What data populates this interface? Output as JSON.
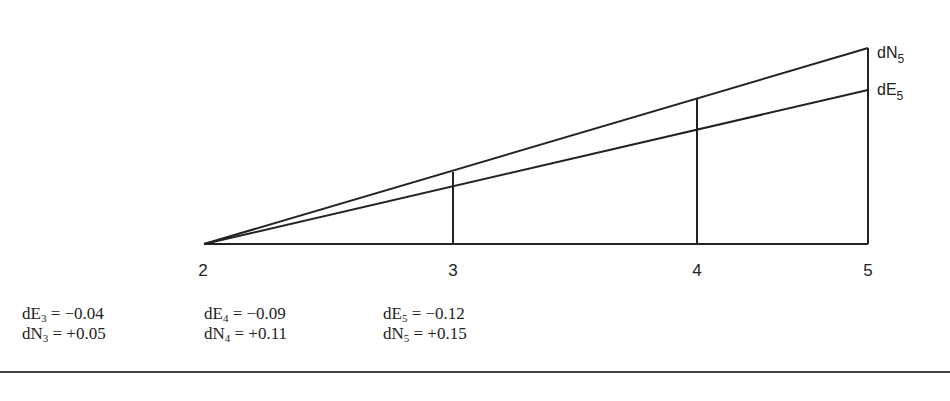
{
  "diagram": {
    "type": "traverse-error-proportioning",
    "stations": [
      {
        "label": "2",
        "x": 204
      },
      {
        "label": "3",
        "x": 453
      },
      {
        "label": "4",
        "x": 697
      },
      {
        "label": "5",
        "x": 868
      }
    ],
    "baseline_y": 244,
    "lines": {
      "dN": {
        "label_main": "dN",
        "label_sub": "5",
        "end_y": 48,
        "crossings_y": [
          172,
          99,
          48
        ]
      },
      "dE": {
        "label_main": "dE",
        "label_sub": "5",
        "end_y": 90,
        "crossings_y": [
          186,
          130,
          90
        ]
      }
    }
  },
  "corrections": [
    {
      "e_main": "dE",
      "e_sub": "3",
      "e_value": "= −0.04",
      "n_main": "dN",
      "n_sub": "3",
      "n_value": "= +0.05"
    },
    {
      "e_main": "dE",
      "e_sub": "4",
      "e_value": "= −0.09",
      "n_main": "dN",
      "n_sub": "4",
      "n_value": "= +0.11"
    },
    {
      "e_main": "dE",
      "e_sub": "5",
      "e_value": "= −0.12",
      "n_main": "dN",
      "n_sub": "5",
      "n_value": "= +0.15"
    }
  ],
  "colors": {
    "ink": "#222222",
    "background": "#ffffff"
  }
}
